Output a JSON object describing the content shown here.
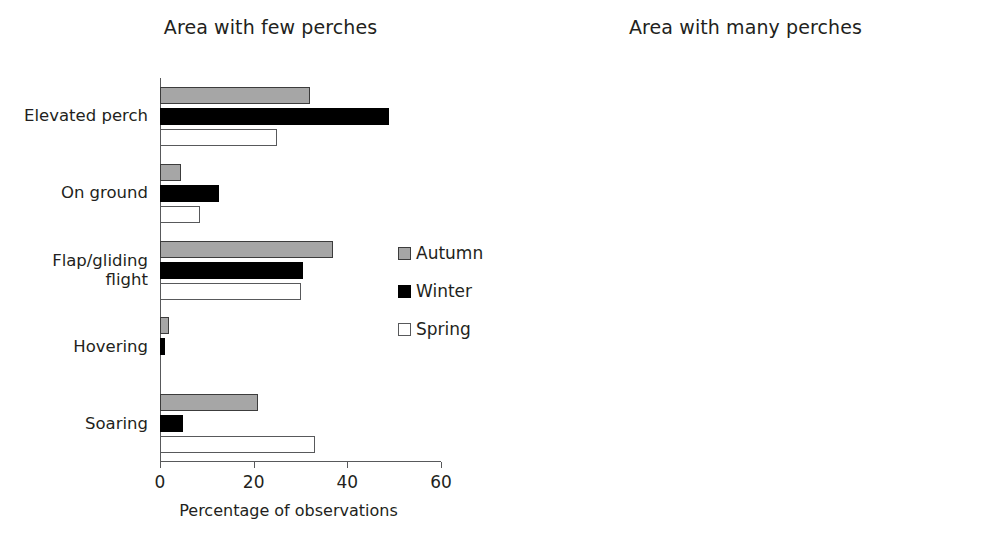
{
  "chart_data": [
    {
      "type": "bar",
      "orientation": "horizontal",
      "title": "Area with few perches",
      "xlabel": "Percentage of observations",
      "ylabel": "",
      "xlim": [
        0,
        60
      ],
      "xticks": [
        0,
        20,
        40,
        60
      ],
      "grid": false,
      "legend": [
        "Autumn",
        "Winter",
        "Spring"
      ],
      "legend_position": "center-right-inside",
      "categories": [
        "Elevated perch",
        "On ground",
        "Flap/gliding flight",
        "Hovering",
        "Soaring"
      ],
      "series": [
        {
          "name": "Autumn",
          "color": "#a6a6a6",
          "values": [
            32,
            4.5,
            37,
            2,
            21
          ]
        },
        {
          "name": "Winter",
          "color": "#000000",
          "values": [
            49,
            12.5,
            30.5,
            1,
            5
          ]
        },
        {
          "name": "Spring",
          "color": "#ffffff",
          "values": [
            25,
            8.5,
            30,
            0,
            33
          ]
        }
      ]
    },
    {
      "type": "bar",
      "orientation": "horizontal",
      "title": "Area with many perches",
      "xlabel": "Percentage of observations",
      "ylabel": "",
      "xlim": [
        0,
        80
      ],
      "xticks": [
        0,
        20,
        40,
        60,
        80
      ],
      "grid": false,
      "legend": [
        "Autumn",
        "Winter",
        "Spring"
      ],
      "legend_position": "none",
      "categories": [
        "Elevated perch",
        "On ground",
        "Flap/gliding flight",
        "Hovering",
        "Soaring"
      ],
      "series": [
        {
          "name": "Autumn",
          "color": "#a6a6a6",
          "values": [
            0,
            0,
            0,
            0,
            0
          ]
        },
        {
          "name": "Winter",
          "color": "#000000",
          "values": [
            60,
            35,
            5.5,
            1,
            0.5
          ]
        },
        {
          "name": "Spring",
          "color": "#ffffff",
          "values": [
            56,
            27,
            12,
            2,
            3
          ]
        }
      ]
    }
  ],
  "left": {
    "title": "Area with few perches",
    "xlabel": "Percentage of observations",
    "ticks": [
      "0",
      "20",
      "40",
      "60"
    ],
    "categories": [
      "Elevated perch",
      "On ground",
      "Flap/gliding\nflight",
      "Hovering",
      "Soaring"
    ]
  },
  "right": {
    "title": "Area with many perches",
    "xlabel": "Percentage of observations",
    "ticks": [
      "0",
      "20",
      "40",
      "60",
      "80"
    ]
  },
  "legend": {
    "items": [
      {
        "label": "Autumn",
        "swatch": "autumn"
      },
      {
        "label": "Winter",
        "swatch": "winter"
      },
      {
        "label": "Spring",
        "swatch": "spring"
      }
    ]
  }
}
